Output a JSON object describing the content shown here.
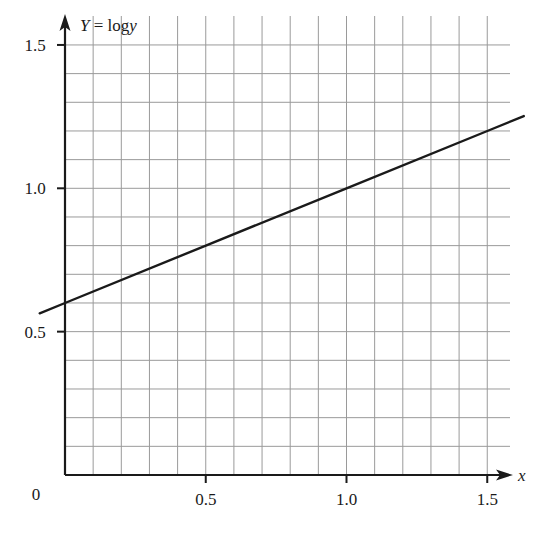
{
  "chart_data": {
    "type": "line",
    "title": "",
    "xlabel": "x",
    "ylabel": "Y = log y",
    "ylabel_parts": {
      "lhs": "Y",
      "eq": " = log",
      "var": "y"
    },
    "xlim": [
      0,
      1.6
    ],
    "ylim": [
      0,
      1.5
    ],
    "x_ticks": [
      0.5,
      1.0,
      1.5
    ],
    "x_tick_labels": [
      "0.5",
      "1.0",
      "1.5"
    ],
    "y_ticks": [
      0.5,
      1.0,
      1.5
    ],
    "y_tick_labels": [
      "0.5",
      "1.0",
      "1.5"
    ],
    "origin_label": "0",
    "grid": true,
    "grid_step": {
      "x": 0.1,
      "y": 0.1
    },
    "legend": null,
    "series": [
      {
        "name": "Y = 0.6 + 0.4x",
        "x": [
          -0.09,
          0,
          0.5,
          1.0,
          1.5,
          1.63
        ],
        "values": [
          0.564,
          0.6,
          0.8,
          1.0,
          1.2,
          1.252
        ],
        "color": "#1a1a1a"
      }
    ],
    "line_equation": {
      "intercept": 0.6,
      "slope": 0.4
    }
  },
  "colors": {
    "axis": "#1a1a1a",
    "grid": "#9a9a9a",
    "line": "#1a1a1a",
    "text": "#1a1a1a"
  }
}
